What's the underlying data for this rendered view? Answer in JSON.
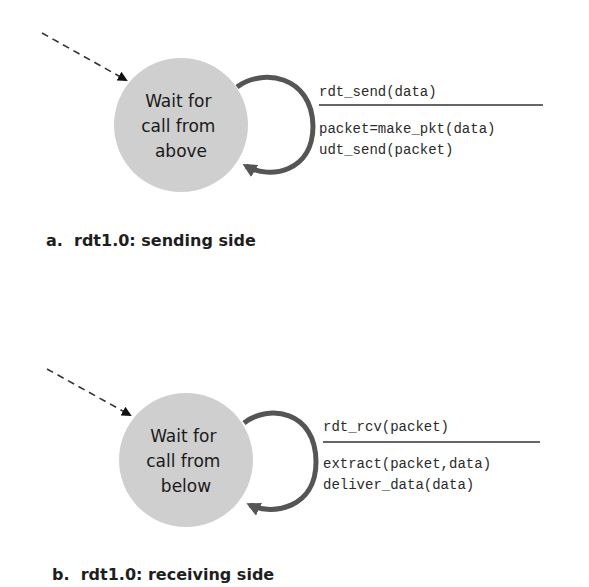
{
  "colors": {
    "state_fill": "#cfcfcf",
    "loop_stroke": "#555555",
    "text": "#1a1a1a",
    "background": "#ffffff"
  },
  "diagrams": [
    {
      "id": "sender",
      "state": {
        "lines": [
          "Wait for",
          "call from",
          "above"
        ]
      },
      "transition": {
        "event": "rdt_send(data)",
        "actions": [
          "packet=make_pkt(data)",
          "udt_send(packet)"
        ]
      },
      "caption": "a.  rdt1.0: sending side"
    },
    {
      "id": "receiver",
      "state": {
        "lines": [
          "Wait for",
          "call from",
          "below"
        ]
      },
      "transition": {
        "event": "rdt_rcv(packet)",
        "actions": [
          "extract(packet,data)",
          "deliver_data(data)"
        ]
      },
      "caption": "b.  rdt1.0: receiving side"
    }
  ]
}
